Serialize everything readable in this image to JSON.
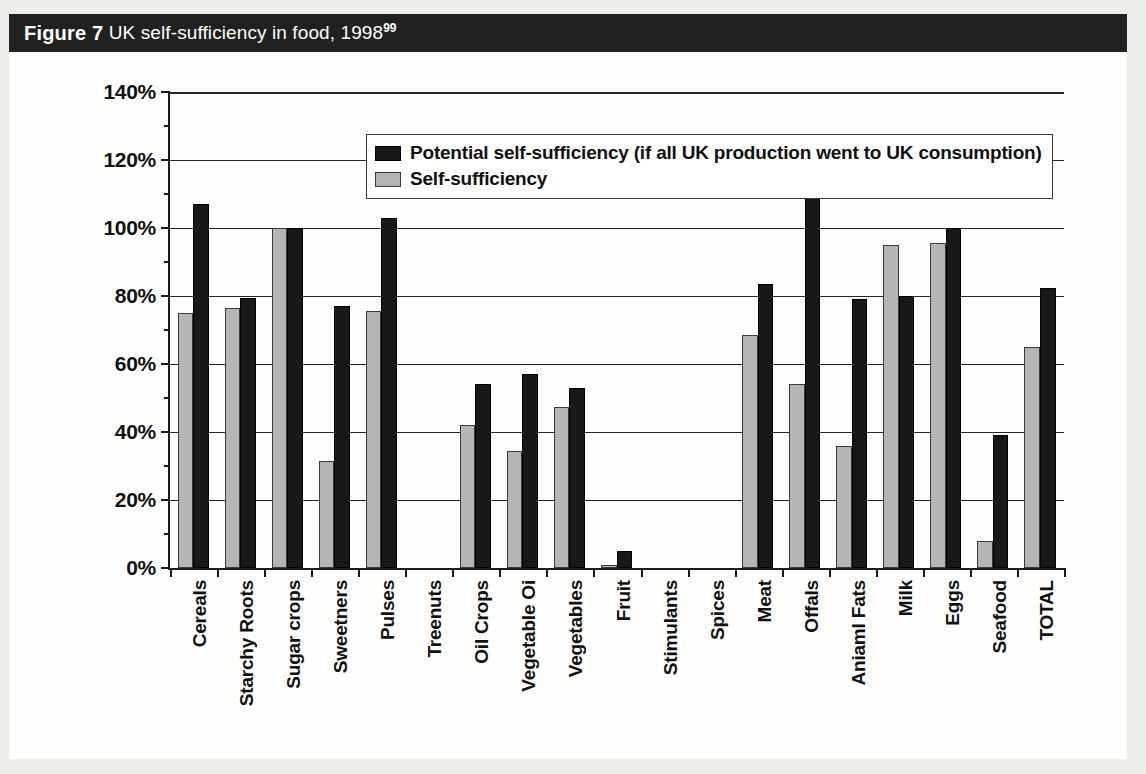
{
  "figure": {
    "number_label": "Figure 7",
    "caption": " UK self-sufficiency in food, 1998",
    "footnote_marker": "99"
  },
  "colors": {
    "caption_bar_bg": "#212121",
    "caption_text": "#ffffff",
    "series_potential": "#181818",
    "series_actual": "#b5b5b5",
    "axis": "#1b1b1b",
    "gridline": "#262626",
    "page_bg": "#efeeea",
    "figure_bg": "#fdfdfc"
  },
  "legend": {
    "position": "top-left-inside-plot",
    "entries": [
      {
        "label": "Potential self-sufficiency (if all UK production went to UK consumption)",
        "swatch": "dark"
      },
      {
        "label": "Self-sufficiency",
        "swatch": "light"
      }
    ]
  },
  "chart_data": {
    "type": "bar",
    "title": "UK self-sufficiency in food, 1998",
    "xlabel": "",
    "ylabel": "",
    "ylim": [
      0,
      140
    ],
    "ytick_values": [
      0,
      20,
      40,
      60,
      80,
      100,
      120,
      140
    ],
    "ytick_labels": [
      "0%",
      "20%",
      "40%",
      "60%",
      "80%",
      "100%",
      "120%",
      "140%"
    ],
    "grid": true,
    "legend_position": "upper left",
    "categories": [
      "Cereals",
      "Starchy Roots",
      "Sugar crops",
      "Sweetners",
      "Pulses",
      "Treenuts",
      "Oil Crops",
      "Vegetable Oi",
      "Vegetables",
      "Fruit",
      "Stimulants",
      "Spices",
      "Meat",
      "Offals",
      "Aniaml Fats",
      "Milk",
      "Eggs",
      "Seafood",
      "TOTAL"
    ],
    "series": [
      {
        "name": "Self-sufficiency",
        "swatch": "light",
        "values": [
          75,
          76.5,
          100,
          31.5,
          75.5,
          0,
          42,
          34.5,
          47.5,
          1,
          0,
          0,
          68.5,
          54,
          36,
          95,
          95.5,
          8,
          65
        ]
      },
      {
        "name": "Potential self-sufficiency (if all UK production went to UK consumption)",
        "swatch": "dark",
        "values": [
          107,
          79.5,
          100,
          77,
          103,
          0,
          54,
          57,
          53,
          5,
          0,
          0,
          83.5,
          127,
          79,
          80,
          100,
          39,
          82.5
        ]
      }
    ]
  }
}
